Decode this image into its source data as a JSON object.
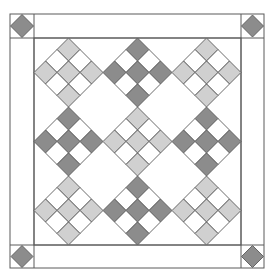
{
  "colors": {
    "background": "#ffffff",
    "line": "#5a5a5a",
    "dark": "#8c8c8c",
    "light": "#d0d0d0",
    "white": "#ffffff"
  },
  "layout": {
    "outer": {
      "x": 10,
      "y": 14,
      "w": 254,
      "h": 254
    },
    "inner": {
      "x": 34,
      "y": 38,
      "w": 207,
      "h": 207
    },
    "border_width": 24
  },
  "corner_squares": [
    {
      "position": "top-left",
      "shade": "dark"
    },
    {
      "position": "top-right",
      "shade": "dark"
    },
    {
      "position": "bottom-left",
      "shade": "dark"
    },
    {
      "position": "bottom-right",
      "shade": "dark"
    }
  ],
  "blocks": {
    "type": "nine-patch on point",
    "rows": 3,
    "cols": 3,
    "shades": [
      [
        "light",
        "dark",
        "light"
      ],
      [
        "dark",
        "light",
        "dark"
      ],
      [
        "light",
        "dark",
        "light"
      ]
    ],
    "colored_cells": "corners and center of each 3x3 patch",
    "white_cells": "edge-midpoint cells"
  }
}
